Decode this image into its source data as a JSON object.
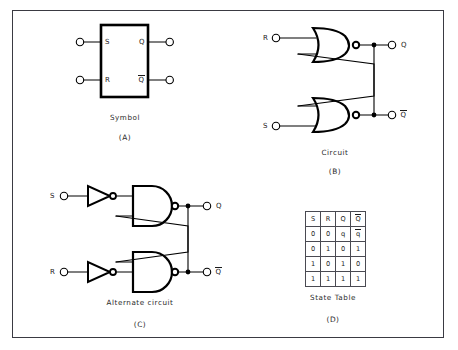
{
  "figure": {
    "border_color": "#3a3a42",
    "line_color": "#000000",
    "background": "#ffffff"
  },
  "panels": [
    {
      "id": "A",
      "letter": "(A)",
      "caption": "Symbol",
      "pins": {
        "in1": "S",
        "in2": "R",
        "out1": "Q",
        "out2": "Q",
        "out2_overbar": true
      }
    },
    {
      "id": "B",
      "letter": "(B)",
      "caption": "Circuit",
      "gate_type": "NOR",
      "pins": {
        "in1": "R",
        "in2": "S",
        "out1": "Q",
        "out2": "Q",
        "out2_overbar": true
      }
    },
    {
      "id": "C",
      "letter": "(C)",
      "caption": "Alternate circuit",
      "gate_type": "NAND",
      "input_stage": "inverter",
      "pins": {
        "in1": "S",
        "in2": "R",
        "out1": "Q",
        "out2": "Q",
        "out2_overbar": true
      }
    },
    {
      "id": "D",
      "letter": "(D)",
      "caption": "State Table"
    }
  ],
  "state_table": {
    "headers": [
      "S",
      "R",
      "Q",
      "Q"
    ],
    "header_overbars": [
      false,
      false,
      false,
      true
    ],
    "rows": [
      {
        "cells": [
          "0",
          "0",
          "q",
          "q"
        ],
        "overbars": [
          false,
          false,
          false,
          true
        ]
      },
      {
        "cells": [
          "0",
          "1",
          "0",
          "1"
        ],
        "overbars": [
          false,
          false,
          false,
          false
        ]
      },
      {
        "cells": [
          "1",
          "0",
          "1",
          "0"
        ],
        "overbars": [
          false,
          false,
          false,
          false
        ]
      },
      {
        "cells": [
          "1",
          "1",
          "1",
          "1"
        ],
        "overbars": [
          false,
          false,
          false,
          false
        ]
      }
    ]
  }
}
